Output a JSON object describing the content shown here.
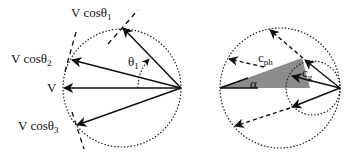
{
  "left_diagram": {
    "labels": {
      "v": "V",
      "v_cos1_main": "V cosθ",
      "v_cos1_sub": "1",
      "v_cos2_main": "V cosθ",
      "v_cos2_sub": "2",
      "v_cos3_main": "V cosθ",
      "v_cos3_sub": "3",
      "theta1_main": "θ",
      "theta1_sub": "1"
    }
  },
  "right_diagram": {
    "labels": {
      "c_ph_main": "c",
      "c_ph_sub": "ph",
      "c_g_main": "c",
      "c_g_sub": "g",
      "alpha": "α"
    },
    "colors": {
      "shade": "#8c8c8c"
    }
  }
}
